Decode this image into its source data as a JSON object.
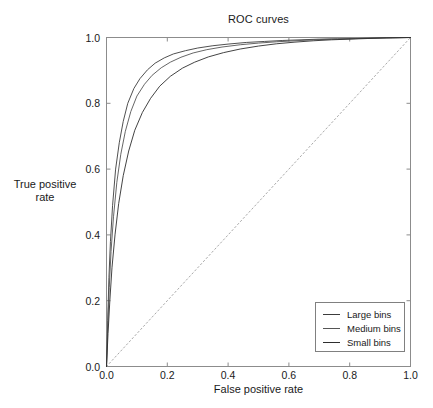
{
  "chart_data": {
    "type": "line",
    "title": "ROC curves",
    "xlabel": "False positive rate",
    "ylabel": "True positive rate",
    "xlim": [
      0.0,
      1.0
    ],
    "ylim": [
      0.0,
      1.0
    ],
    "grid": false,
    "legend_position": "lower right",
    "xticks": [
      "0.0",
      "0.2",
      "0.4",
      "0.6",
      "0.8",
      "1.0"
    ],
    "xtick_values": [
      0.0,
      0.2,
      0.4,
      0.6,
      0.8,
      1.0
    ],
    "yticks": [
      "0.0",
      "0.2",
      "0.4",
      "0.6",
      "0.8",
      "1.0"
    ],
    "ytick_values": [
      0.0,
      0.2,
      0.4,
      0.6,
      0.8,
      1.0
    ],
    "series": [
      {
        "name": "Large bins",
        "color": "#3c3c3c",
        "x": [
          0.0,
          0.004,
          0.008,
          0.013,
          0.02,
          0.03,
          0.042,
          0.055,
          0.07,
          0.09,
          0.11,
          0.135,
          0.16,
          0.19,
          0.22,
          0.26,
          0.3,
          0.35,
          0.4,
          0.46,
          0.52,
          0.58,
          0.64,
          0.7,
          0.76,
          0.82,
          0.88,
          0.94,
          1.0
        ],
        "y": [
          0.0,
          0.14,
          0.27,
          0.38,
          0.49,
          0.6,
          0.68,
          0.745,
          0.8,
          0.845,
          0.875,
          0.902,
          0.922,
          0.938,
          0.95,
          0.96,
          0.968,
          0.975,
          0.98,
          0.985,
          0.988,
          0.991,
          0.993,
          0.995,
          0.996,
          0.997,
          0.998,
          0.999,
          1.0
        ]
      },
      {
        "name": "Medium bins",
        "color": "#555555",
        "x": [
          0.0,
          0.004,
          0.009,
          0.015,
          0.023,
          0.034,
          0.047,
          0.062,
          0.08,
          0.1,
          0.125,
          0.15,
          0.18,
          0.21,
          0.245,
          0.285,
          0.33,
          0.38,
          0.44,
          0.5,
          0.56,
          0.62,
          0.68,
          0.74,
          0.8,
          0.86,
          0.92,
          1.0
        ],
        "y": [
          0.0,
          0.12,
          0.24,
          0.35,
          0.455,
          0.56,
          0.645,
          0.715,
          0.775,
          0.822,
          0.858,
          0.885,
          0.908,
          0.925,
          0.94,
          0.953,
          0.963,
          0.971,
          0.978,
          0.983,
          0.987,
          0.99,
          0.993,
          0.995,
          0.996,
          0.998,
          0.999,
          1.0
        ]
      },
      {
        "name": "Small bins",
        "color": "#2e2e2e",
        "x": [
          0.0,
          0.005,
          0.011,
          0.018,
          0.028,
          0.04,
          0.055,
          0.073,
          0.093,
          0.118,
          0.145,
          0.175,
          0.21,
          0.25,
          0.29,
          0.335,
          0.385,
          0.44,
          0.5,
          0.56,
          0.62,
          0.68,
          0.74,
          0.8,
          0.86,
          0.92,
          1.0
        ],
        "y": [
          0.0,
          0.1,
          0.2,
          0.3,
          0.4,
          0.495,
          0.58,
          0.655,
          0.718,
          0.772,
          0.815,
          0.852,
          0.882,
          0.907,
          0.925,
          0.941,
          0.954,
          0.965,
          0.974,
          0.981,
          0.986,
          0.99,
          0.993,
          0.995,
          0.997,
          0.999,
          1.0
        ]
      }
    ],
    "reference_line": {
      "name": "chance-diagonal",
      "style": "dotted",
      "color": "#aaaaaa",
      "x": [
        0.0,
        1.0
      ],
      "y": [
        0.0,
        1.0
      ]
    }
  }
}
